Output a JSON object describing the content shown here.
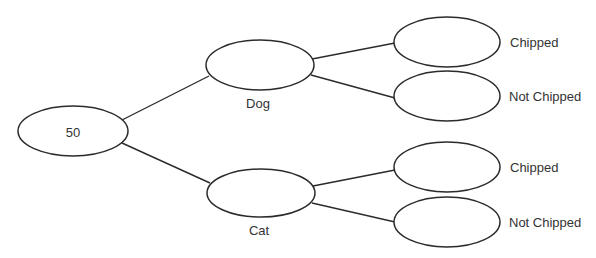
{
  "diagram": {
    "type": "tree-diagram",
    "root": {
      "label": "50"
    },
    "level1": [
      {
        "label": "Dog",
        "children": [
          {
            "label": "Chipped"
          },
          {
            "label": "Not Chipped"
          }
        ]
      },
      {
        "label": "Cat",
        "children": [
          {
            "label": "Chipped"
          },
          {
            "label": "Not Chipped"
          }
        ]
      }
    ],
    "colors": {
      "stroke": "#2b2b2b",
      "text": "#333333",
      "background": "#ffffff"
    }
  }
}
